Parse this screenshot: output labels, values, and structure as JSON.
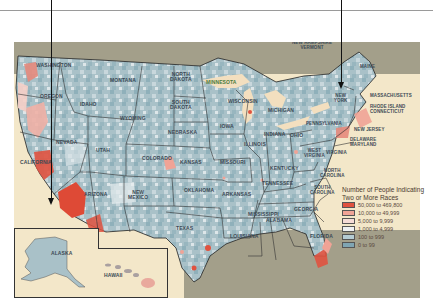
{
  "map": {
    "type": "choropleth",
    "region": "United States",
    "states": [
      {
        "name": "WASHINGTON",
        "x": 22,
        "y": 63
      },
      {
        "name": "OREGON",
        "x": 40,
        "y": 92
      },
      {
        "name": "IDAHO",
        "x": 80,
        "y": 102
      },
      {
        "name": "MONTANA",
        "x": 112,
        "y": 79
      },
      {
        "name": "WYOMING",
        "x": 120,
        "y": 116
      },
      {
        "name": "NEVADA",
        "x": 55,
        "y": 140
      },
      {
        "name": "UTAH",
        "x": 94,
        "y": 149
      },
      {
        "name": "COLORADO",
        "x": 140,
        "y": 156
      },
      {
        "name": "CALIFORNIA",
        "x": 20,
        "y": 160
      },
      {
        "name": "ARIZONA",
        "x": 83,
        "y": 193
      },
      {
        "name": "NEW\nMEXICO",
        "x": 128,
        "y": 193
      },
      {
        "name": "NORTH\nDAKOTA",
        "x": 170,
        "y": 74
      },
      {
        "name": "MINNESOTA",
        "x": 200,
        "y": 78
      },
      {
        "name": "SOUTH\nDAKOTA",
        "x": 170,
        "y": 102
      },
      {
        "name": "NEBRASKA",
        "x": 168,
        "y": 130
      },
      {
        "name": "KANSAS",
        "x": 180,
        "y": 160
      },
      {
        "name": "OKLAHOMA",
        "x": 185,
        "y": 189
      },
      {
        "name": "TEXAS",
        "x": 179,
        "y": 226
      },
      {
        "name": "IOWA",
        "x": 218,
        "y": 124
      },
      {
        "name": "MISSOURI",
        "x": 220,
        "y": 160
      },
      {
        "name": "ARKANSAS",
        "x": 223,
        "y": 192
      },
      {
        "name": "LOUISIANA",
        "x": 230,
        "y": 234
      },
      {
        "name": "WISCONSIN",
        "x": 230,
        "y": 99
      },
      {
        "name": "ILLINOIS",
        "x": 244,
        "y": 142
      },
      {
        "name": "MISSISSIPPI",
        "x": 249,
        "y": 211
      },
      {
        "name": "ALABAMA",
        "x": 266,
        "y": 218
      },
      {
        "name": "TENNESSEE",
        "x": 262,
        "y": 181
      },
      {
        "name": "KENTUCKY",
        "x": 266,
        "y": 166
      },
      {
        "name": "INDIANA",
        "x": 262,
        "y": 132
      },
      {
        "name": "MICHIGAN",
        "x": 265,
        "y": 108
      },
      {
        "name": "OHIO",
        "x": 287,
        "y": 133
      },
      {
        "name": "GEORGIA",
        "x": 292,
        "y": 207
      },
      {
        "name": "FLORIDA",
        "x": 311,
        "y": 234
      },
      {
        "name": "SOUTH\nCAROLINA",
        "x": 310,
        "y": 185
      },
      {
        "name": "NORTH\nCAROLINA",
        "x": 320,
        "y": 168
      },
      {
        "name": "VIRGINIA",
        "x": 320,
        "y": 150
      },
      {
        "name": "WEST\nVIRGINIA",
        "x": 303,
        "y": 148
      },
      {
        "name": "PENNSYLVANIA",
        "x": 308,
        "y": 121
      },
      {
        "name": "NEW\nYORK",
        "x": 334,
        "y": 93
      },
      {
        "name": "MAINE",
        "x": 362,
        "y": 65
      }
    ],
    "callouts": [
      {
        "name": "NEW HAMPSHIRE\nVERMONT",
        "x": 298,
        "y": 52
      },
      {
        "name": "MASSACHUSETTS",
        "x": 370,
        "y": 93
      },
      {
        "name": "RHODE ISLAND\nCONNECTICUT",
        "x": 370,
        "y": 107
      },
      {
        "name": "NEW JERSEY",
        "x": 355,
        "y": 127
      },
      {
        "name": "DELAWARE\nMARYLAND",
        "x": 350,
        "y": 139
      }
    ],
    "insets": [
      {
        "name": "ALASKA"
      },
      {
        "name": "HAWAII"
      }
    ]
  },
  "legend": {
    "title": "Number of People Indicating Two or More Races",
    "items": [
      {
        "label": "50,000 to 469,800",
        "color": "#e0523f"
      },
      {
        "label": "10,000 to 49,999",
        "color": "#f0a396"
      },
      {
        "label": "5,000 to 9,999",
        "color": "#f5dcd6"
      },
      {
        "label": "1,000 to 4,999",
        "color": "#eef1f2"
      },
      {
        "label": "100 to 999",
        "color": "#b5ccd3"
      },
      {
        "label": "0 to 99",
        "color": "#7fa5b3"
      }
    ]
  },
  "colors": {
    "ocean": "#f3e7c9",
    "foreign_land": "#a39f8a",
    "us_base": "#a9c1c8",
    "lakes": "#f3dfbf",
    "borders": "#222222"
  }
}
